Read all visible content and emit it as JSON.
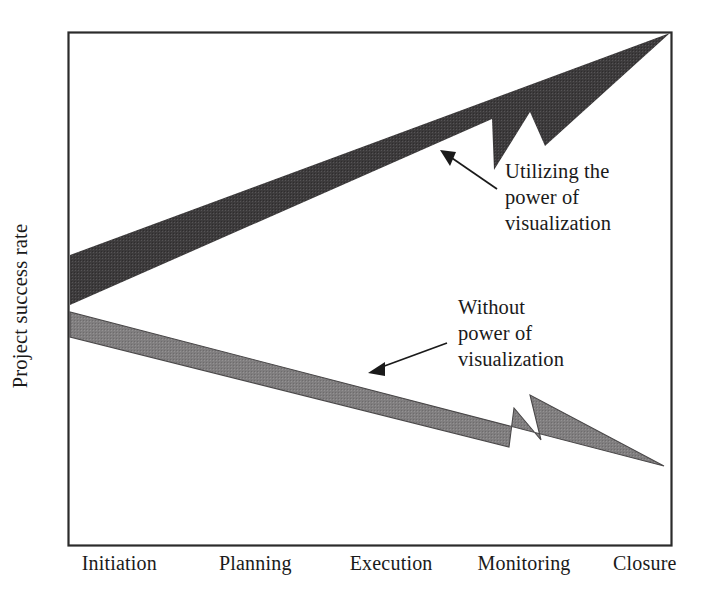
{
  "chart_data": {
    "type": "line",
    "title": "",
    "xlabel": "",
    "ylabel": "Project success rate",
    "categories": [
      "Initiation",
      "Planning",
      "Execution",
      "Monitoring",
      "Closure"
    ],
    "grid": false,
    "legend": "annotations-inline",
    "ylim": [
      0,
      100
    ],
    "series": [
      {
        "name": "Utilizing the power of visualization",
        "style": "thick-upward-arrow",
        "color": "#3d3b3c",
        "values": [
          43,
          57,
          71,
          85,
          99
        ]
      },
      {
        "name": "Without power of visualization",
        "style": "thick-downward-arrow",
        "color": "#807e7f",
        "values": [
          37,
          28,
          20,
          11,
          3
        ]
      }
    ],
    "annotations": [
      {
        "id": "utilizing",
        "text": "Utilizing the\npower of\nvisualization",
        "points_to_series": "Utilizing the power of visualization"
      },
      {
        "id": "without",
        "text": "Without\npower of\nvisualization",
        "points_to_series": "Without power of visualization"
      }
    ]
  },
  "axes": {
    "y_label": "Project success rate",
    "x_ticks": [
      {
        "label": "Initiation",
        "x_pct": 8.5
      },
      {
        "label": "Planning",
        "x_pct": 31.0
      },
      {
        "label": "Execution",
        "x_pct": 53.5
      },
      {
        "label": "Monitoring",
        "x_pct": 75.5
      },
      {
        "label": "Closure",
        "x_pct": 95.5
      }
    ]
  },
  "annotations": {
    "utilizing": "Utilizing the\npower of\nvisualization",
    "without": "Without\npower of\nvisualization"
  },
  "colors": {
    "upward_arrow": "#3d3b3c",
    "downward_arrow": "#807e7f",
    "frame": "#2b2b2b",
    "text": "#1a1a1a",
    "background": "#ffffff"
  }
}
